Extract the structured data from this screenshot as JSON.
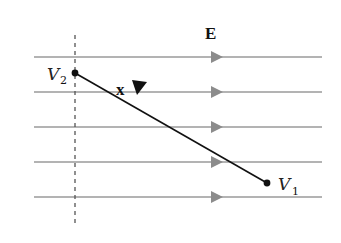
{
  "figure": {
    "field_label": "E",
    "displacement_label": "x",
    "point_start": {
      "name": "V",
      "subscript": "2"
    },
    "point_end": {
      "name": "V",
      "subscript": "1"
    },
    "field_line_count": 5,
    "colors": {
      "field_line": "#9a9a9a",
      "field_arrow": "#8c8c8c",
      "displacement": "#111111",
      "dashed": "#555555"
    }
  }
}
